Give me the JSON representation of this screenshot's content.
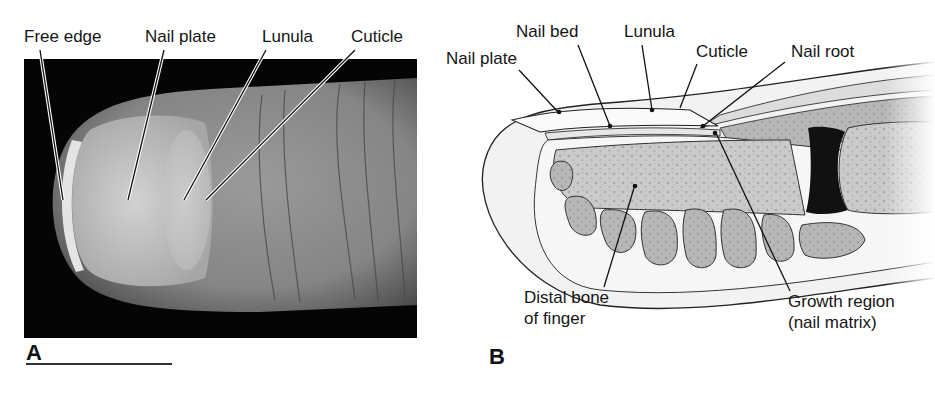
{
  "figure": {
    "panel_a": {
      "letter": "A",
      "description": "Photograph of fingertip showing nail",
      "labels": {
        "free_edge": "Free edge",
        "nail_plate": "Nail plate",
        "lunula": "Lunula",
        "cuticle": "Cuticle"
      }
    },
    "panel_b": {
      "letter": "B",
      "description": "Sagittal section diagram of fingertip and nail",
      "labels": {
        "nail_plate": "Nail plate",
        "nail_bed": "Nail bed",
        "lunula": "Lunula",
        "cuticle": "Cuticle",
        "nail_root": "Nail root",
        "distal_bone_line1": "Distal bone",
        "distal_bone_line2": "of finger",
        "growth_region_line1": "Growth region",
        "growth_region_line2": "(nail matrix)"
      }
    },
    "colors": {
      "photo_background": "#050505",
      "skin": "#8a8a8a",
      "nail": "#c8c8c8",
      "bone": "#c9c9c9",
      "fat": "#b4b4b4",
      "outline": "#222222"
    }
  }
}
